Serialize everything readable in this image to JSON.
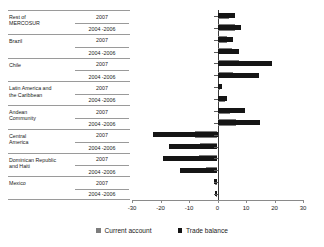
{
  "chart_data": {
    "type": "bar",
    "orientation": "horizontal",
    "title": "",
    "xlabel": "",
    "ylabel": "",
    "xlim": [
      -30,
      30
    ],
    "xticks": [
      -30,
      -20,
      -10,
      0,
      10,
      20,
      30
    ],
    "xtick_labels": [
      "-30",
      "-20",
      "-10",
      "0",
      "10",
      "20",
      "30"
    ],
    "grid": false,
    "legend_position": "bottom-center",
    "legend": [
      "Current account",
      "Trade balance"
    ],
    "colors": {
      "current_account": "#7d7d7d",
      "trade_balance": "#151515",
      "axis": "#8a8a8a",
      "rule": "#9a9a9a",
      "background": "#ffffff"
    },
    "groups": [
      {
        "name": "Rest of MERCOSUR",
        "name_lines": [
          "Rest of",
          "MERCOSUR"
        ],
        "rows": [
          {
            "period": "2007",
            "current_account": 4.0,
            "trade_balance": 6.3
          },
          {
            "period": "2004 -2006",
            "current_account": 6.0,
            "trade_balance": 8.2
          }
        ]
      },
      {
        "name": "Brazil",
        "name_lines": [
          "Brazil"
        ],
        "rows": [
          {
            "period": "2007",
            "current_account": 3.2,
            "trade_balance": 5.3
          },
          {
            "period": "2004 -2006",
            "current_account": 5.2,
            "trade_balance": 7.5
          }
        ]
      },
      {
        "name": "Chile",
        "name_lines": [
          "Chile"
        ],
        "rows": [
          {
            "period": "2007",
            "current_account": 7.5,
            "trade_balance": 19.0
          },
          {
            "period": "2004 -2006",
            "current_account": 5.5,
            "trade_balance": 14.5
          }
        ]
      },
      {
        "name": "Latin America and the Caribbean",
        "name_lines": [
          "Latin America and",
          "the Caribbean"
        ],
        "rows": [
          {
            "period": "2007",
            "current_account": 1.0,
            "trade_balance": 1.6
          },
          {
            "period": "2004 -2006",
            "current_account": 2.5,
            "trade_balance": 3.5
          }
        ]
      },
      {
        "name": "Andean Community",
        "name_lines": [
          "Andean",
          "Community"
        ],
        "rows": [
          {
            "period": "2007",
            "current_account": 4.5,
            "trade_balance": 9.5
          },
          {
            "period": "2004 -2006",
            "current_account": 6.5,
            "trade_balance": 14.8
          }
        ]
      },
      {
        "name": "Central America",
        "name_lines": [
          "Central",
          "America"
        ],
        "rows": [
          {
            "period": "2007",
            "current_account": -8.0,
            "trade_balance": -22.5
          },
          {
            "period": "2004 -2006",
            "current_account": -6.0,
            "trade_balance": -17.0
          }
        ]
      },
      {
        "name": "Dominican Republic and Haiti",
        "name_lines": [
          "Dominican Republic",
          "and Haiti"
        ],
        "rows": [
          {
            "period": "2007",
            "current_account": -6.5,
            "trade_balance": -19.0
          },
          {
            "period": "2004 -2006",
            "current_account": -4.0,
            "trade_balance": -13.0
          }
        ]
      },
      {
        "name": "Mexico",
        "name_lines": [
          "Mexico"
        ],
        "rows": [
          {
            "period": "2007",
            "current_account": -0.8,
            "trade_balance": -1.2
          },
          {
            "period": "2004 -2006",
            "current_account": -0.6,
            "trade_balance": -1.0
          }
        ]
      }
    ]
  }
}
